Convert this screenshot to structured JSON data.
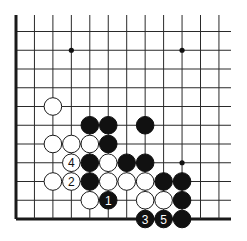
{
  "diagram": {
    "type": "go-board-fragment",
    "grid": {
      "cols": 12,
      "rows": 11,
      "origin_x": 16,
      "origin_y": 31.5,
      "spacing_x": 18.45,
      "spacing_y": 18.75,
      "top_line_extent_y": 15,
      "right_line_extent_x": 231,
      "edges": [
        "left",
        "bottom"
      ]
    },
    "colors": {
      "black_stone": "#111111",
      "white_stone": "#ffffff",
      "line": "#2a2a2a",
      "background": "#ffffff"
    },
    "star_points": [
      {
        "col": 3,
        "row": 1
      },
      {
        "col": 9,
        "row": 1
      },
      {
        "col": 9,
        "row": 7
      }
    ],
    "stones": [
      {
        "color": "white",
        "col": 2,
        "row": 4,
        "label": ""
      },
      {
        "color": "black",
        "col": 4,
        "row": 5,
        "label": ""
      },
      {
        "color": "black",
        "col": 5,
        "row": 5,
        "label": ""
      },
      {
        "color": "black",
        "col": 7,
        "row": 5,
        "label": ""
      },
      {
        "color": "white",
        "col": 2,
        "row": 6,
        "label": ""
      },
      {
        "color": "white",
        "col": 3,
        "row": 6,
        "label": ""
      },
      {
        "color": "white",
        "col": 4,
        "row": 6,
        "label": ""
      },
      {
        "color": "black",
        "col": 5,
        "row": 6,
        "label": ""
      },
      {
        "color": "white",
        "col": 3,
        "row": 7,
        "label": "4"
      },
      {
        "color": "black",
        "col": 4,
        "row": 7,
        "label": ""
      },
      {
        "color": "white",
        "col": 5,
        "row": 7,
        "label": ""
      },
      {
        "color": "black",
        "col": 6,
        "row": 7,
        "label": ""
      },
      {
        "color": "black",
        "col": 7,
        "row": 7,
        "label": ""
      },
      {
        "color": "white",
        "col": 2,
        "row": 8,
        "label": ""
      },
      {
        "color": "white",
        "col": 3,
        "row": 8,
        "label": "2"
      },
      {
        "color": "black",
        "col": 4,
        "row": 8,
        "label": ""
      },
      {
        "color": "white",
        "col": 5,
        "row": 8,
        "label": ""
      },
      {
        "color": "white",
        "col": 6,
        "row": 8,
        "label": ""
      },
      {
        "color": "white",
        "col": 7,
        "row": 8,
        "label": ""
      },
      {
        "color": "black",
        "col": 8,
        "row": 8,
        "label": ""
      },
      {
        "color": "black",
        "col": 9,
        "row": 8,
        "label": ""
      },
      {
        "color": "white",
        "col": 4,
        "row": 9,
        "label": ""
      },
      {
        "color": "black",
        "col": 5,
        "row": 9,
        "label": "1"
      },
      {
        "color": "white",
        "col": 7,
        "row": 9,
        "label": ""
      },
      {
        "color": "white",
        "col": 8,
        "row": 9,
        "label": ""
      },
      {
        "color": "black",
        "col": 9,
        "row": 9,
        "label": ""
      },
      {
        "color": "black",
        "col": 7,
        "row": 10,
        "label": "3"
      },
      {
        "color": "black",
        "col": 8,
        "row": 10,
        "label": "5"
      },
      {
        "color": "black",
        "col": 9,
        "row": 10,
        "label": ""
      }
    ],
    "move_sequence": [
      {
        "move": "1",
        "color": "black"
      },
      {
        "move": "2",
        "color": "white"
      },
      {
        "move": "3",
        "color": "black"
      },
      {
        "move": "4",
        "color": "white"
      },
      {
        "move": "5",
        "color": "black"
      }
    ]
  }
}
